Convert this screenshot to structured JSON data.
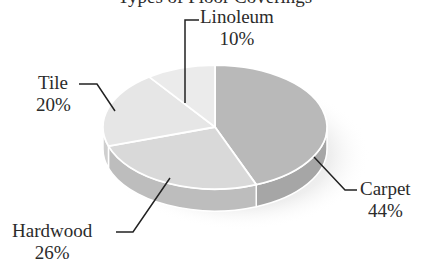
{
  "chart_data": {
    "type": "pie",
    "style": "3d",
    "title": "Types of Floor Coverings",
    "title_visible": "partially cut off at top edge",
    "categories": [
      "Carpet",
      "Hardwood",
      "Tile",
      "Linoleum"
    ],
    "values": [
      44,
      26,
      20,
      10
    ],
    "unit": "%",
    "labels": [
      {
        "name": "Carpet",
        "value": "44%"
      },
      {
        "name": "Hardwood",
        "value": "26%"
      },
      {
        "name": "Tile",
        "value": "20%"
      },
      {
        "name": "Linoleum",
        "value": "10%"
      }
    ],
    "start_angle_deg": 0,
    "direction": "clockwise",
    "legend": "none (leader-line labels)"
  },
  "colors": {
    "Carpet": {
      "top": "#b9b9b9",
      "side": "#a6a6a6"
    },
    "Hardwood": {
      "top": "#d9d9d9",
      "side": "#bdbdbd"
    },
    "Tile": {
      "top": "#e6e6e6",
      "side": "#cfcfcf"
    },
    "Linoleum": {
      "top": "#ebebeb",
      "side": "#d2d2d2"
    },
    "edge": "#ffffff",
    "leader": "#222222"
  }
}
